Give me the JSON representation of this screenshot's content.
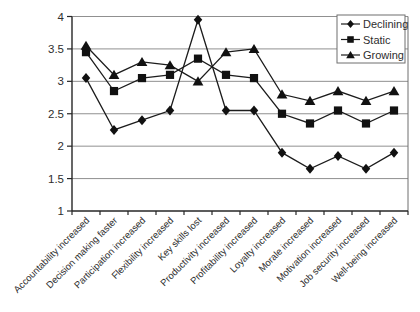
{
  "figure": {
    "background": "#ffffff"
  },
  "chart_data": {
    "type": "line",
    "title": "",
    "xlabel": "",
    "ylabel": "",
    "categories": [
      "Accountability increased",
      "Decision making faster",
      "Participation increased",
      "Flexibility increased",
      "Key skills lost",
      "Productivity increased",
      "Profitability increased",
      "Loyalty increased",
      "Morale increased",
      "Motivation increased",
      "Job security increased",
      "Well-being increased"
    ],
    "series": [
      {
        "name": "Declining",
        "marker": "diamond",
        "color": "#1c1c1c",
        "values": [
          3.05,
          2.25,
          2.4,
          2.55,
          3.95,
          2.55,
          2.55,
          1.9,
          1.65,
          1.85,
          1.65,
          1.9
        ]
      },
      {
        "name": "Static",
        "marker": "square",
        "color": "#1c1c1c",
        "values": [
          3.45,
          2.85,
          3.05,
          3.1,
          3.35,
          3.1,
          3.05,
          2.5,
          2.35,
          2.55,
          2.35,
          2.55
        ]
      },
      {
        "name": "Growing",
        "marker": "triangle",
        "color": "#1c1c1c",
        "values": [
          3.55,
          3.1,
          3.3,
          3.25,
          3.0,
          3.45,
          3.5,
          2.8,
          2.7,
          2.85,
          2.7,
          2.85
        ]
      }
    ],
    "ylim": [
      1,
      4
    ],
    "yticks": [
      1,
      1.5,
      2,
      2.5,
      3,
      3.5,
      4
    ],
    "ytick_labels": [
      "1",
      "1.5",
      "2",
      "2.5",
      "3",
      "3.5",
      "4"
    ],
    "grid": "horizontal",
    "gridline_color": "#909090",
    "axis_color": "#262626",
    "marker_color": "#111111",
    "legend": {
      "position": "top-right",
      "border_color": "#6f6f6f",
      "background": "#ffffff"
    }
  }
}
